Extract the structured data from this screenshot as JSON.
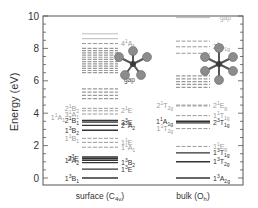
{
  "chart_data": {
    "type": "energy-level-diagram",
    "ylabel": "Energy (eV)",
    "ylim": [
      0,
      10
    ],
    "yticks": [
      "0",
      "2",
      "4",
      "6",
      "8",
      "10"
    ],
    "columns": [
      {
        "name": "surface",
        "label": "surface (C",
        "label_sub": "4v",
        "label_end": ")",
        "levels": [
          {
            "e": 0.0,
            "style": "solid",
            "label": "1",
            "sup": "3",
            "term": "B",
            "sub": "1",
            "side": "left"
          },
          {
            "e": 0.55,
            "style": "solid",
            "label": "1",
            "sup": "3",
            "term": "E",
            "sub": "",
            "side": "right"
          },
          {
            "e": 0.95,
            "style": "solid",
            "label": "1",
            "sup": "3",
            "term": "B",
            "sub": "2",
            "side": "right"
          },
          {
            "e": 1.1,
            "style": "solid",
            "label": "1",
            "sup": "3",
            "term": "A",
            "sub": "2",
            "side": "left"
          },
          {
            "e": 1.2,
            "style": "solid",
            "label": "2",
            "sup": "3",
            "term": "E",
            "sub": "",
            "side": "left"
          },
          {
            "e": 1.3,
            "style": "solid",
            "label": "",
            "sup": "",
            "term": "",
            "sub": "",
            "side": "none"
          },
          {
            "e": 1.9,
            "style": "dashed",
            "label": "1",
            "sup": "1",
            "term": "A",
            "sub": "1",
            "side": "right"
          },
          {
            "e": 2.2,
            "style": "dashed",
            "label": "1",
            "sup": "1",
            "term": "E",
            "sub": "",
            "side": "right"
          },
          {
            "e": 2.45,
            "style": "dashed",
            "label": "1",
            "sup": "1",
            "term": "B",
            "sub": "1",
            "side": "left"
          },
          {
            "e": 2.95,
            "style": "solid",
            "label": "1",
            "sup": "3",
            "term": "B",
            "sub": "2",
            "side": "left"
          },
          {
            "e": 3.25,
            "style": "solid",
            "label": "2",
            "sup": "3",
            "term": "A",
            "sub": "2",
            "side": "right"
          },
          {
            "e": 3.45,
            "style": "solid",
            "label": "3",
            "sup": "3",
            "term": "E",
            "sub": "",
            "side": "right"
          },
          {
            "e": 3.55,
            "style": "solid",
            "label": "2",
            "sup": "1",
            "term": "B",
            "sub": "1",
            "side": "left"
          },
          {
            "e": 3.95,
            "style": "dashed",
            "label": "3",
            "sup": "1",
            "term": "A",
            "sub": "1",
            "side": "left"
          },
          {
            "e": 4.15,
            "style": "dashed",
            "label": "2",
            "sup": "1",
            "term": "E",
            "sub": "",
            "side": "right"
          },
          {
            "e": 4.3,
            "style": "dashed",
            "label": "2",
            "sup": "1",
            "term": "B",
            "sub": "2",
            "side": "left"
          }
        ],
        "extra_labels": [
          {
            "e": 3.75,
            "text": "1",
            "sup": "1",
            "term": "A",
            "sub": "1",
            "pos": "far-left"
          }
        ],
        "high_block": {
          "from": 4.9,
          "to": 5.5,
          "count": 4
        },
        "upper_block": {
          "from": 6.5,
          "to": 8.0,
          "count": 12
        },
        "top_levels": [
          {
            "e": 8.3,
            "style": "dashed",
            "label": "4",
            "sup": "1",
            "term": "A",
            "sub": "1"
          },
          {
            "e": 8.6,
            "style": "solid"
          },
          {
            "e": 8.9,
            "style": "solid"
          }
        ],
        "gap_label": "gap"
      },
      {
        "name": "bulk",
        "label": "bulk (O",
        "label_sub": "h",
        "label_end": ")",
        "levels": [
          {
            "e": 0.0,
            "style": "solid",
            "label": "1",
            "sup": "3",
            "term": "A",
            "sub": "2g",
            "side": "right"
          },
          {
            "e": 1.0,
            "style": "solid",
            "label": "1",
            "sup": "3",
            "term": "T",
            "sub": "2g",
            "side": "right"
          },
          {
            "e": 1.55,
            "style": "solid",
            "label": "1",
            "sup": "3",
            "term": "T",
            "sub": "1g",
            "side": "right"
          },
          {
            "e": 1.95,
            "style": "dashed",
            "label": "1",
            "sup": "1",
            "term": "E",
            "sub": "g",
            "side": "right"
          },
          {
            "e": 3.05,
            "style": "dashed",
            "label": "1",
            "sup": "1",
            "term": "T",
            "sub": "2g",
            "side": "left"
          },
          {
            "e": 3.4,
            "style": "solid",
            "label": "2",
            "sup": "3",
            "term": "T",
            "sub": "1g",
            "side": "right"
          },
          {
            "e": 3.5,
            "style": "solid",
            "label": "1",
            "sup": "1",
            "term": "A",
            "sub": "1g",
            "side": "left"
          },
          {
            "e": 3.85,
            "style": "dashed",
            "label": "1",
            "sup": "1",
            "term": "T",
            "sub": "1g",
            "side": "right"
          },
          {
            "e": 4.45,
            "style": "dashed",
            "label": "2",
            "sup": "1",
            "term": "E",
            "sub": "g",
            "side": "right"
          },
          {
            "e": 4.5,
            "style": "dashed",
            "label": "2",
            "sup": "1",
            "term": "T",
            "sub": "2g",
            "side": "left"
          }
        ],
        "upper_block": {
          "from": 5.6,
          "to": 6.3,
          "count": 5
        },
        "top_levels": [
          {
            "e": 7.7,
            "style": "dashed"
          },
          {
            "e": 8.1,
            "style": "dashed",
            "label": "2",
            "sup": "1",
            "term": "A",
            "sub": "1g"
          },
          {
            "e": 8.45,
            "style": "dashed"
          },
          {
            "e": 9.9,
            "style": "solid"
          }
        ],
        "gap_label": "gap"
      }
    ]
  },
  "colors": {
    "solid": "#333333",
    "dashed": "#9a9a9a",
    "axis": "#555555",
    "label_dark": "#333333",
    "label_light": "#9a9a9a",
    "molecule_ball": "#8c8c8c",
    "molecule_center": "#3a3a3a"
  }
}
